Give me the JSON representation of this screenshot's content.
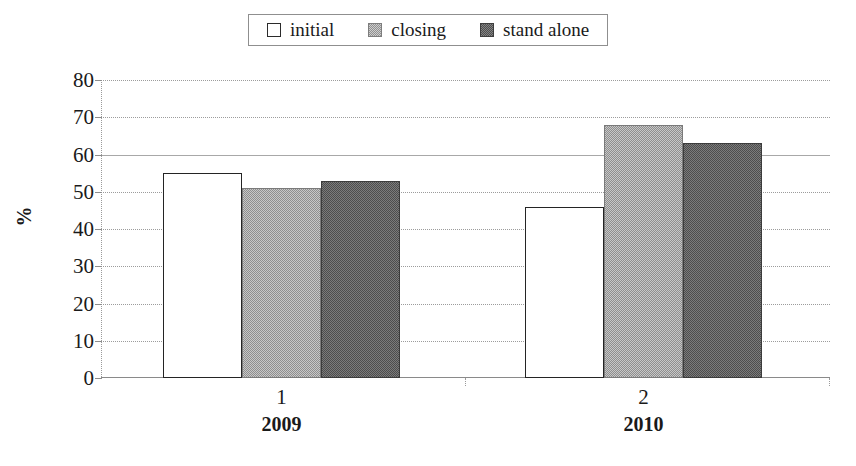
{
  "legend": {
    "position": "top-center",
    "items": [
      {
        "label": "initial",
        "swatch": "legend-swatch-initial",
        "color": "#ffffff"
      },
      {
        "label": "closing",
        "swatch": "legend-swatch-closing",
        "color": "#8e8e8e"
      },
      {
        "label": "stand alone",
        "swatch": "legend-swatch-stand-alone",
        "color": "#4d4d4d"
      }
    ]
  },
  "axes": {
    "ylabel": "%",
    "yticks": [
      "80",
      "70",
      "60",
      "50",
      "40",
      "30",
      "20",
      "10",
      "0"
    ],
    "xticks": [
      "1",
      "2"
    ],
    "xgroups": [
      "2009",
      "2010"
    ]
  },
  "chart_data": {
    "type": "bar",
    "title": "",
    "xlabel": "",
    "ylabel": "%",
    "ylim": [
      0,
      80
    ],
    "ytick_step": 10,
    "grid": true,
    "legend_position": "top-center",
    "categories": [
      "1",
      "2"
    ],
    "category_groups": [
      "2009",
      "2010"
    ],
    "series": [
      {
        "name": "initial",
        "values": [
          55,
          46
        ]
      },
      {
        "name": "closing",
        "values": [
          51,
          68
        ]
      },
      {
        "name": "stand alone",
        "values": [
          53,
          63
        ]
      }
    ]
  },
  "caption": {
    "text": ""
  }
}
